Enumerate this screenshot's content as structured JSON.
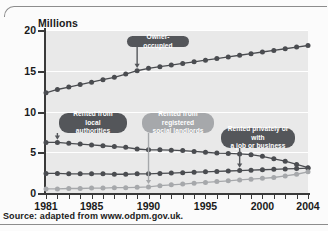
{
  "chart_data": {
    "type": "line",
    "title": "",
    "xlabel": "",
    "ylabel": "Millions",
    "xlim": [
      1981,
      2004
    ],
    "ylim": [
      0,
      20
    ],
    "yticks": [
      0,
      5,
      10,
      15,
      20
    ],
    "xticks_labeled": [
      1981,
      1985,
      1990,
      1995,
      2000,
      2004
    ],
    "grid": "horizontal-white",
    "legend": "none-inline-callouts",
    "x": [
      1981,
      1982,
      1983,
      1984,
      1985,
      1986,
      1987,
      1988,
      1989,
      1990,
      1991,
      1992,
      1993,
      1994,
      1995,
      1996,
      1997,
      1998,
      1999,
      2000,
      2001,
      2002,
      2003,
      2004
    ],
    "series": [
      {
        "name": "Owner-occupied",
        "color": "#4a4c50",
        "values": [
          12.3,
          12.7,
          13.0,
          13.3,
          13.6,
          13.9,
          14.2,
          14.6,
          15.0,
          15.3,
          15.5,
          15.7,
          15.9,
          16.1,
          16.3,
          16.5,
          16.7,
          16.9,
          17.1,
          17.3,
          17.5,
          17.7,
          17.9,
          18.1
        ]
      },
      {
        "name": "Rented from local authorities",
        "color": "#4a4c50",
        "values": [
          6.2,
          6.2,
          6.1,
          6.0,
          5.9,
          5.8,
          5.7,
          5.6,
          5.4,
          5.3,
          5.3,
          5.25,
          5.2,
          5.1,
          5.0,
          4.9,
          4.85,
          4.8,
          4.7,
          4.5,
          4.2,
          3.9,
          3.5,
          3.1
        ]
      },
      {
        "name": "Rented privately or with a job or business",
        "color": "#4a4c50",
        "values": [
          2.4,
          2.4,
          2.35,
          2.35,
          2.35,
          2.35,
          2.3,
          2.3,
          2.35,
          2.35,
          2.4,
          2.45,
          2.5,
          2.55,
          2.6,
          2.65,
          2.7,
          2.75,
          2.8,
          2.85,
          2.9,
          2.95,
          3.0,
          3.05
        ]
      },
      {
        "name": "Rented from registered social landlords",
        "color": "#a6a8ab",
        "values": [
          0.5,
          0.5,
          0.55,
          0.55,
          0.6,
          0.6,
          0.65,
          0.65,
          0.7,
          0.75,
          0.9,
          1.0,
          1.1,
          1.2,
          1.3,
          1.4,
          1.5,
          1.6,
          1.7,
          1.8,
          1.9,
          2.1,
          2.3,
          2.6
        ]
      }
    ],
    "annotations": [
      {
        "name": "owner-occupied",
        "text": "Owner-occupied",
        "style": "dark",
        "points_to_year": 1989,
        "points_to_value": 15.0
      },
      {
        "name": "rented-local-authorities",
        "text": "Rented from local\nauthorities",
        "style": "dark",
        "points_to_year": 1982,
        "points_to_value": 6.2
      },
      {
        "name": "rented-registered-social-landlords",
        "text": "Rented from registered\nsocial landlords",
        "style": "light",
        "points_to_year": 1990,
        "points_to_value": 0.75
      },
      {
        "name": "rented-privately-or-job",
        "text": "Rented privately or with\na job or business",
        "style": "dark",
        "points_to_year": 1998,
        "points_to_value": 2.75
      }
    ]
  },
  "axis": {
    "y_title": "Millions",
    "y_labels": [
      "0",
      "5",
      "10",
      "15",
      "20"
    ],
    "x_labels": [
      "1981",
      "1985",
      "1990",
      "1995",
      "2000",
      "2004"
    ]
  },
  "source": {
    "text": "Source: adapted from www.odpm.gov.uk."
  }
}
